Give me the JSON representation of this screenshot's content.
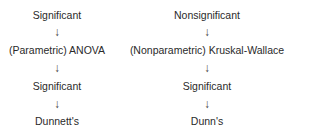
{
  "flowchart": {
    "left": {
      "steps": [
        "Significant",
        "(Parametric) ANOVA",
        "Significant",
        "Dunnett's"
      ],
      "arrow": "↓"
    },
    "right": {
      "steps": [
        "Nonsignificant",
        "(Nonparametric) Kruskal-Wallace",
        "Significant",
        "Dunn's"
      ],
      "arrow": "↓"
    }
  }
}
